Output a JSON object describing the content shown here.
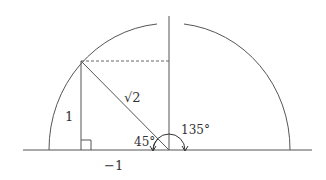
{
  "diagram": {
    "type": "unit-angle-on-semicircle",
    "labels": {
      "opposite_side": "1",
      "hypotenuse": "√2",
      "reference_angle": "45°",
      "standard_angle": "135°",
      "x_coordinate": "−1"
    },
    "colors": {
      "stroke": "#555555",
      "background": "#ffffff"
    }
  }
}
